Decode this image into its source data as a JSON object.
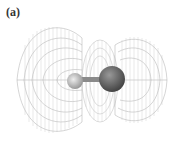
{
  "figure": {
    "panel_label": "(a)",
    "colors": {
      "wireframe": "#b0b0b0",
      "small_atom": "#c8c8c8",
      "large_atom": "#6a6a6a",
      "bond": "#8a8a8a"
    }
  }
}
